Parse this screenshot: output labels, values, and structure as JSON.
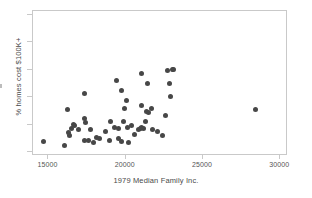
{
  "chart_data": {
    "type": "scatter",
    "title": "",
    "xlabel": "1979 Median Family Inc.",
    "ylabel": "% homes cost $100K+",
    "xlim": [
      14000,
      30500
    ],
    "ylim": [
      0,
      100
    ],
    "grid": false,
    "legend": null,
    "xticks": [
      15000,
      20000,
      25000,
      30000
    ],
    "xtick_labels": [
      "15000",
      "20000",
      "25000",
      "30000"
    ],
    "yticks": [],
    "ytick_labels": [],
    "marker": {
      "shape": "circle",
      "color": "#474747",
      "size_px": 5
    },
    "point_count": 55,
    "points": [
      {
        "x": 14650,
        "y": 10
      },
      {
        "x": 16050,
        "y": 7
      },
      {
        "x": 16200,
        "y": 32
      },
      {
        "x": 16300,
        "y": 16
      },
      {
        "x": 16350,
        "y": 14
      },
      {
        "x": 16500,
        "y": 19
      },
      {
        "x": 16600,
        "y": 22
      },
      {
        "x": 16700,
        "y": 21
      },
      {
        "x": 16950,
        "y": 18
      },
      {
        "x": 17300,
        "y": 43
      },
      {
        "x": 17350,
        "y": 26
      },
      {
        "x": 17400,
        "y": 23
      },
      {
        "x": 17300,
        "y": 11
      },
      {
        "x": 17600,
        "y": 11
      },
      {
        "x": 17700,
        "y": 18
      },
      {
        "x": 17900,
        "y": 9
      },
      {
        "x": 18100,
        "y": 13
      },
      {
        "x": 18300,
        "y": 12
      },
      {
        "x": 18700,
        "y": 17
      },
      {
        "x": 19000,
        "y": 24
      },
      {
        "x": 18950,
        "y": 11
      },
      {
        "x": 19300,
        "y": 20
      },
      {
        "x": 19400,
        "y": 52
      },
      {
        "x": 19500,
        "y": 19
      },
      {
        "x": 19550,
        "y": 12
      },
      {
        "x": 19700,
        "y": 45
      },
      {
        "x": 19750,
        "y": 10
      },
      {
        "x": 19850,
        "y": 24
      },
      {
        "x": 19900,
        "y": 33
      },
      {
        "x": 20050,
        "y": 38
      },
      {
        "x": 20100,
        "y": 20
      },
      {
        "x": 20150,
        "y": 9
      },
      {
        "x": 20400,
        "y": 21
      },
      {
        "x": 20550,
        "y": 15
      },
      {
        "x": 20800,
        "y": 18
      },
      {
        "x": 20950,
        "y": 19
      },
      {
        "x": 21000,
        "y": 20
      },
      {
        "x": 21000,
        "y": 35
      },
      {
        "x": 21050,
        "y": 57
      },
      {
        "x": 21150,
        "y": 19
      },
      {
        "x": 21250,
        "y": 24
      },
      {
        "x": 21350,
        "y": 31
      },
      {
        "x": 21400,
        "y": 50
      },
      {
        "x": 21500,
        "y": 30
      },
      {
        "x": 21650,
        "y": 33
      },
      {
        "x": 21750,
        "y": 18
      },
      {
        "x": 22050,
        "y": 17
      },
      {
        "x": 22350,
        "y": 14
      },
      {
        "x": 22550,
        "y": 28
      },
      {
        "x": 22700,
        "y": 59
      },
      {
        "x": 22800,
        "y": 50
      },
      {
        "x": 22900,
        "y": 41
      },
      {
        "x": 23000,
        "y": 60
      },
      {
        "x": 23100,
        "y": 60
      },
      {
        "x": 28400,
        "y": 32
      }
    ]
  }
}
